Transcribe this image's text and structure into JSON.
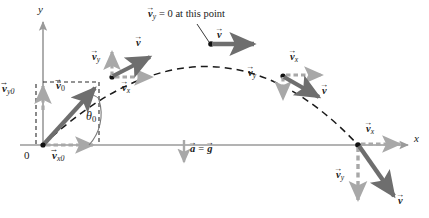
{
  "figure": {
    "type": "physics-diagram"
  },
  "axes": {
    "x_label": "x",
    "y_label": "y",
    "origin_label": "0",
    "axis_color": "#9a9a9a",
    "x_axis_y": 145,
    "y_axis_x": 43
  },
  "trajectory": {
    "style": "dashed",
    "color": "#1a1a1a",
    "launch_point": [
      43,
      145
    ],
    "apex_point": [
      210,
      43
    ],
    "landing_point": [
      358,
      145
    ]
  },
  "colors": {
    "resultant_vector": "#6e6e6e",
    "component_vector": "#a8a8a8",
    "dashed_guide": "#2b2b2b",
    "text": "#1a1a1a",
    "axis": "#9a9a9a"
  },
  "annotations": {
    "apex_note": "= 0 at this point",
    "apex_note_vector": "v",
    "apex_note_sub": "y",
    "accel_left": "a",
    "accel_eq": "=",
    "accel_right": "g"
  },
  "vector_labels": {
    "v0": {
      "symbol": "v",
      "sub": "0"
    },
    "vx0": {
      "symbol": "v",
      "sub": "x0"
    },
    "vy0": {
      "symbol": "v",
      "sub": "y0"
    },
    "v": {
      "symbol": "v",
      "sub": ""
    },
    "vx": {
      "symbol": "v",
      "sub": "x"
    },
    "vy": {
      "symbol": "v",
      "sub": "y"
    },
    "theta": "θ",
    "theta_sub": "0"
  },
  "points": [
    {
      "name": "launch",
      "x": 43,
      "y": 145,
      "labels": [
        "v0",
        "vx0",
        "vy0",
        "theta"
      ]
    },
    {
      "name": "ascending",
      "x": 112,
      "y": 76,
      "labels": [
        "v",
        "vx",
        "vy"
      ]
    },
    {
      "name": "apex",
      "x": 211,
      "y": 43,
      "labels": [
        "v"
      ]
    },
    {
      "name": "descending",
      "x": 283,
      "y": 76,
      "labels": [
        "v",
        "vx",
        "vy"
      ]
    },
    {
      "name": "landing",
      "x": 358,
      "y": 145,
      "labels": [
        "v",
        "vx",
        "vy"
      ]
    }
  ]
}
